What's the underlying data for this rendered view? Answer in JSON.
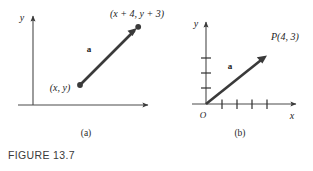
{
  "figure": {
    "caption": "FIGURE 13.7",
    "background_color": "#ffffff",
    "ink_color": "#3a3a3a"
  },
  "panel_a": {
    "caption": "(a)",
    "y_axis_label": "y",
    "vector_label": "a",
    "tail_point_label": "(x, y)",
    "head_point_label": "(x + 4, y + 3)",
    "geometry": {
      "tail": [
        80,
        85
      ],
      "head": [
        137,
        28
      ],
      "y_axis_x": 33,
      "x_axis_y": 105
    }
  },
  "panel_b": {
    "caption": "(b)",
    "y_axis_label": "y",
    "x_axis_label": "x",
    "origin_label": "O",
    "vector_label": "a",
    "point_label": "P(4, 3)",
    "x_tick_count": 4,
    "y_tick_count": 3,
    "geometry": {
      "origin": [
        206,
        104
      ],
      "head": [
        266,
        56
      ]
    }
  }
}
